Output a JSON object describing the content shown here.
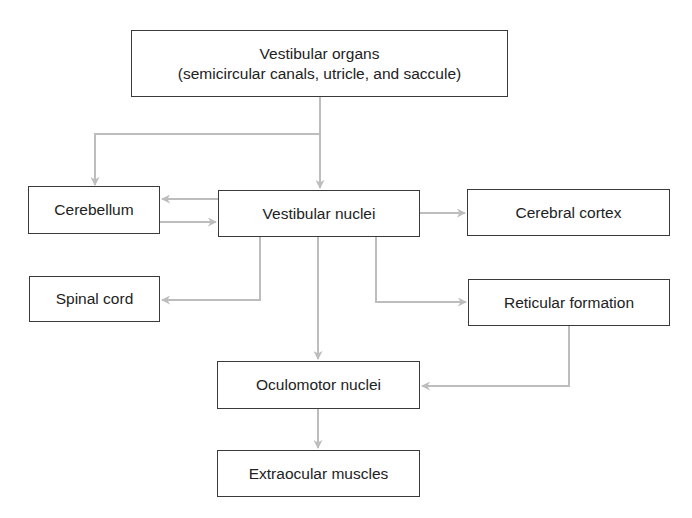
{
  "diagram": {
    "type": "flowchart",
    "line_color": "#bdbdbd",
    "border_color": "#3a3a3a",
    "nodes": {
      "vestibular_organs": {
        "line1": "Vestibular organs",
        "line2": "(semicircular canals, utricle, and saccule)"
      },
      "cerebellum": {
        "label": "Cerebellum"
      },
      "vestibular_nuclei": {
        "label": "Vestibular nuclei"
      },
      "cerebral_cortex": {
        "label": "Cerebral cortex"
      },
      "spinal_cord": {
        "label": "Spinal cord"
      },
      "reticular_formation": {
        "label": "Reticular formation"
      },
      "oculomotor_nuclei": {
        "label": "Oculomotor nuclei"
      },
      "extraocular_muscles": {
        "label": "Extraocular muscles"
      }
    },
    "edges": [
      {
        "from": "Vestibular organs",
        "to": "Cerebellum"
      },
      {
        "from": "Vestibular organs",
        "to": "Vestibular nuclei"
      },
      {
        "from": "Vestibular nuclei",
        "to": "Cerebellum"
      },
      {
        "from": "Cerebellum",
        "to": "Vestibular nuclei"
      },
      {
        "from": "Vestibular nuclei",
        "to": "Cerebral cortex"
      },
      {
        "from": "Vestibular nuclei",
        "to": "Spinal cord"
      },
      {
        "from": "Vestibular nuclei",
        "to": "Reticular formation"
      },
      {
        "from": "Vestibular nuclei",
        "to": "Oculomotor nuclei"
      },
      {
        "from": "Reticular formation",
        "to": "Oculomotor nuclei"
      },
      {
        "from": "Oculomotor nuclei",
        "to": "Extraocular muscles"
      }
    ]
  }
}
